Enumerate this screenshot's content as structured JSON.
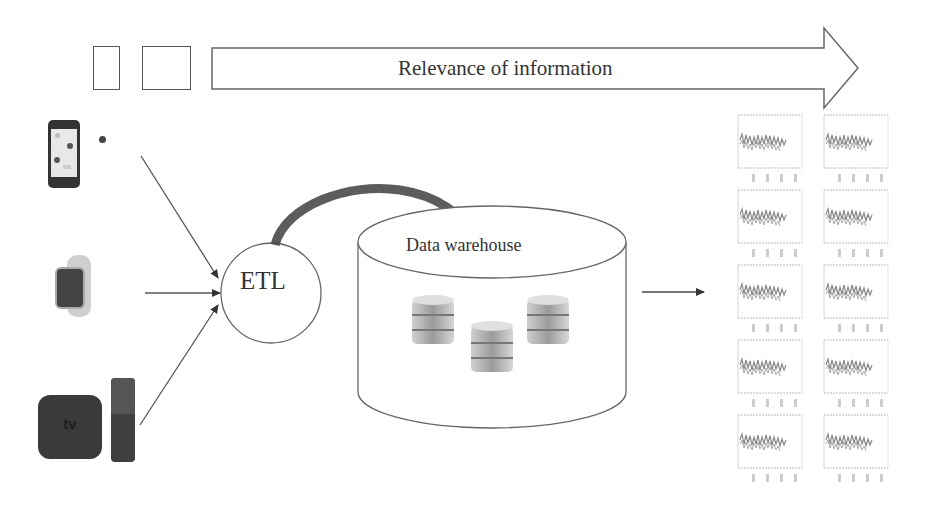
{
  "diagram": {
    "relevance_arrow": {
      "label": "Relevance of information"
    },
    "legend_boxes": [
      {
        "shape": "portrait-rectangle"
      },
      {
        "shape": "square"
      }
    ],
    "sources": [
      {
        "name": "iPhone",
        "icon": "smartphone-icon"
      },
      {
        "name": "Apple Watch",
        "icon": "smartwatch-icon"
      },
      {
        "name": "Apple TV",
        "icon": "apple-tv-icon",
        "badge": "tv"
      }
    ],
    "etl": {
      "label": "ETL"
    },
    "warehouse": {
      "label": "Data warehouse",
      "databases": 3
    },
    "outputs": {
      "rows": 5,
      "cols": 2,
      "type": "signal-plots"
    }
  },
  "colors": {
    "stroke": "#555555",
    "text": "#333333",
    "device_dark": "#3a3a3a",
    "curved_arrow": "#4a4a4a"
  }
}
